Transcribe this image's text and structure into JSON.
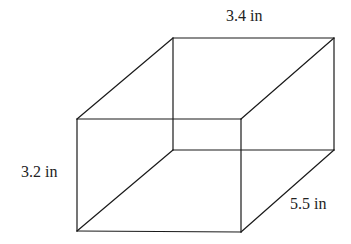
{
  "diagram": {
    "type": "rectangular-prism",
    "labels": {
      "length": "3.4 in",
      "height": "3.2 in",
      "depth": "5.5 in"
    },
    "colors": {
      "stroke": "#1a1a1a",
      "text": "#222222",
      "background": "#ffffff"
    }
  }
}
